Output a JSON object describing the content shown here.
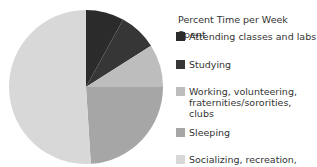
{
  "chart_data": {
    "type": "pie",
    "title": "Percent Time per Week Spent",
    "categories": [
      "Attending classes and labs",
      "Studying",
      "Working, volunteering, fraternities/sororities, clubs",
      "Sleeping",
      "Socializing, recreation, other"
    ],
    "values": [
      8,
      8,
      9,
      24,
      51
    ],
    "colors": [
      "#2b2b2b",
      "#363636",
      "#bdbdbd",
      "#a6a6a6",
      "#d8d8d8"
    ],
    "legend_position": "right",
    "start_angle": "top, clockwise"
  },
  "legend": {
    "title": "Percent Time per Week Spent",
    "items": [
      {
        "label": "Attending classes and labs",
        "color": "#2b2b2b"
      },
      {
        "label": "Studying",
        "color": "#363636"
      },
      {
        "label": "Working, volunteering,",
        "label2": "fraternities/sororities, clubs",
        "color": "#bdbdbd"
      },
      {
        "label": "Sleeping",
        "color": "#a6a6a6"
      },
      {
        "label": "Socializing, recreation, other",
        "color": "#d8d8d8"
      }
    ]
  }
}
